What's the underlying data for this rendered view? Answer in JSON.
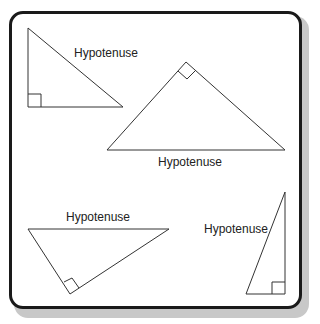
{
  "diagram": {
    "colors": {
      "frame": "#1a1a1a",
      "shadow": "#c8c8c8",
      "line": "#333333"
    },
    "triangles": [
      {
        "id": "t1",
        "label": "Hypotenuse",
        "right_angle": "bottom-left"
      },
      {
        "id": "t2",
        "label": "Hypotenuse",
        "right_angle": "top"
      },
      {
        "id": "t3",
        "label": "Hypotenuse",
        "right_angle": "bottom"
      },
      {
        "id": "t4",
        "label": "Hypotenuse",
        "right_angle": "bottom-right"
      }
    ]
  }
}
